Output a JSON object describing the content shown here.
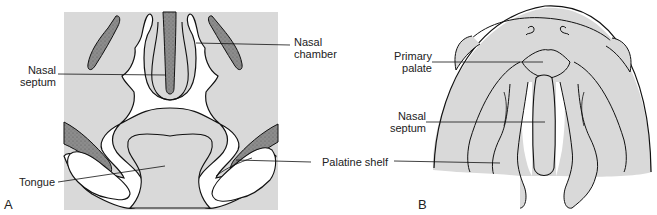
{
  "figure": {
    "panels": [
      {
        "id": "A",
        "letter": "A",
        "labels": {
          "nasal_chamber": [
            "Nasal",
            "chamber"
          ],
          "nasal_septum": [
            "Nasal",
            "septum"
          ],
          "tongue": "Tongue"
        }
      },
      {
        "id": "B",
        "letter": "B",
        "labels": {
          "primary_palate": [
            "Primary",
            "palate"
          ],
          "nasal_septum": [
            "Nasal",
            "septum"
          ]
        }
      }
    ],
    "shared_labels": {
      "palatine_shelf": "Palatine shelf"
    },
    "colors": {
      "background_panel": "#d9d9d9",
      "stippled_bone": "#8a8a8a",
      "cavity": "#ffffff",
      "outline": "#111111"
    }
  }
}
